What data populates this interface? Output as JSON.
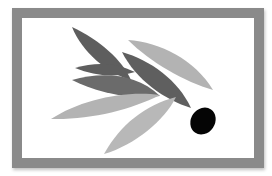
{
  "artwork": {
    "subject": "olive branch with olive",
    "frame_color": "#8a8a8a",
    "background_color": "#ffffff",
    "colors": {
      "dark_leaf": "#5e5e5e",
      "mid_leaf": "#6b6b6b",
      "light_leaf": "#b3b3b3",
      "olive": "#050505"
    },
    "leaves": [
      {
        "name": "top-dark-leaf",
        "tone": "dark_leaf"
      },
      {
        "name": "upper-left-small-leaf",
        "tone": "dark_leaf"
      },
      {
        "name": "left-dark-leaf",
        "tone": "mid_leaf"
      },
      {
        "name": "center-dark-leaf",
        "tone": "mid_leaf"
      },
      {
        "name": "top-right-light-leaf",
        "tone": "light_leaf"
      },
      {
        "name": "left-light-leaf",
        "tone": "light_leaf"
      },
      {
        "name": "bottom-light-leaf",
        "tone": "light_leaf"
      }
    ],
    "olive": {
      "name": "olive",
      "tone": "olive"
    }
  }
}
